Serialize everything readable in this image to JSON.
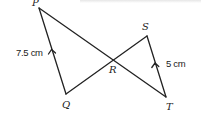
{
  "diagram": {
    "type": "geometry",
    "stroke_color": "#222222",
    "vertices": {
      "P": {
        "label": "P",
        "x": 39,
        "y": 8
      },
      "Q": {
        "label": "Q",
        "x": 66,
        "y": 94
      },
      "R": {
        "label": "R",
        "x": 113,
        "y": 60
      },
      "S": {
        "label": "S",
        "x": 147,
        "y": 36
      },
      "T": {
        "label": "T",
        "x": 166,
        "y": 97
      }
    },
    "segments": [
      {
        "from": "P",
        "to": "Q",
        "length_label": "7.5 cm",
        "parallel_marker": true
      },
      {
        "from": "P",
        "to": "T"
      },
      {
        "from": "Q",
        "to": "S"
      },
      {
        "from": "S",
        "to": "T",
        "length_label": "5 cm",
        "parallel_marker": true
      }
    ],
    "measurements": {
      "PQ": "7.5 cm",
      "ST": "5 cm"
    }
  }
}
